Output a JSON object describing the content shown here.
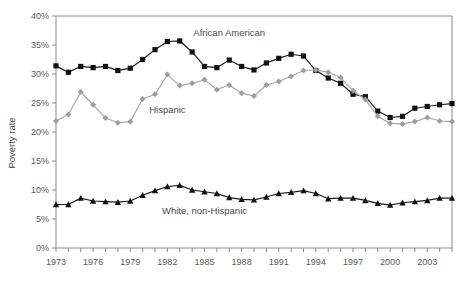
{
  "chart_data": {
    "type": "line",
    "title": "",
    "xlabel": "",
    "ylabel": "Poverty rate",
    "ylim": [
      0,
      40
    ],
    "xlim": [
      1973,
      2005
    ],
    "grid": false,
    "legend_position": "inline-annotations",
    "ytick_labels": [
      "0%",
      "5%",
      "10%",
      "15%",
      "20%",
      "25%",
      "30%",
      "35%",
      "40%"
    ],
    "ytick_values": [
      0,
      5,
      10,
      15,
      20,
      25,
      30,
      35,
      40
    ],
    "xtick_labels": [
      "1973",
      "1976",
      "1979",
      "1982",
      "1985",
      "1988",
      "1991",
      "1994",
      "1997",
      "2000",
      "2003"
    ],
    "xtick_values": [
      1973,
      1976,
      1979,
      1982,
      1985,
      1988,
      1991,
      1994,
      1997,
      2000,
      2003
    ],
    "x": [
      1973,
      1974,
      1975,
      1976,
      1977,
      1978,
      1979,
      1980,
      1981,
      1982,
      1983,
      1984,
      1985,
      1986,
      1987,
      1988,
      1989,
      1990,
      1991,
      1992,
      1993,
      1994,
      1995,
      1996,
      1997,
      1998,
      1999,
      2000,
      2001,
      2002,
      2003,
      2004,
      2005
    ],
    "series": [
      {
        "name": "African American",
        "marker": "square",
        "color": "#111111",
        "values": [
          31.4,
          30.3,
          31.3,
          31.1,
          31.3,
          30.6,
          31.0,
          32.5,
          34.2,
          35.6,
          35.7,
          33.8,
          31.3,
          31.1,
          32.4,
          31.3,
          30.7,
          31.9,
          32.7,
          33.4,
          33.1,
          30.6,
          29.3,
          28.4,
          26.5,
          26.1,
          23.6,
          22.5,
          22.7,
          24.1,
          24.4,
          24.7,
          24.9
        ]
      },
      {
        "name": "Hispanic",
        "marker": "diamond",
        "color": "#9e9e9e",
        "values": [
          21.9,
          23.0,
          26.9,
          24.7,
          22.4,
          21.6,
          21.8,
          25.7,
          26.5,
          29.9,
          28.0,
          28.4,
          29.0,
          27.3,
          28.1,
          26.7,
          26.2,
          28.1,
          28.7,
          29.6,
          30.6,
          30.7,
          30.3,
          29.4,
          27.1,
          25.6,
          22.7,
          21.5,
          21.4,
          21.8,
          22.5,
          21.9,
          21.8
        ]
      },
      {
        "name": "White, non-Hispanic",
        "marker": "triangle",
        "color": "#111111",
        "values": [
          7.5,
          7.5,
          8.6,
          8.1,
          8.0,
          7.9,
          8.1,
          9.1,
          9.9,
          10.6,
          10.8,
          10.0,
          9.7,
          9.4,
          8.7,
          8.4,
          8.3,
          8.8,
          9.4,
          9.6,
          9.9,
          9.4,
          8.5,
          8.6,
          8.6,
          8.2,
          7.7,
          7.4,
          7.8,
          8.0,
          8.2,
          8.6,
          8.6
        ]
      }
    ],
    "annotations": [
      {
        "text": "African American",
        "x": 1987.0,
        "y": 36.5
      },
      {
        "text": "Hispanic",
        "x": 1982.0,
        "y": 23.3
      },
      {
        "text": "White, non-Hispanic",
        "x": 1985.0,
        "y": 5.9
      }
    ]
  }
}
